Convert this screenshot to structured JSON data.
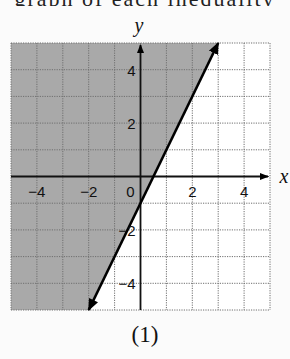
{
  "header_fragment": "graph of each inequality",
  "caption": "(1)",
  "colors": {
    "shade": "#a9a9a9",
    "grid": "#6f6f6f",
    "axis": "#111111",
    "line": "#000000",
    "background": "#fbfbfb"
  },
  "chart_data": {
    "type": "line",
    "title": "",
    "caption": "(1)",
    "xlabel": "x",
    "ylabel": "y",
    "xlim": [
      -5,
      5
    ],
    "ylim": [
      -5,
      5
    ],
    "grid": true,
    "grid_step": 1,
    "x_tick_labels": [
      "-4",
      "-2",
      "0",
      "2",
      "4"
    ],
    "y_tick_labels": [
      "4",
      "2",
      "-2",
      "-4"
    ],
    "series": [
      {
        "name": "boundary line y = 2x - 1",
        "style": "solid",
        "arrows": "both ends",
        "x": [
          -2,
          3
        ],
        "y": [
          -5,
          5
        ]
      }
    ],
    "shaded_region": {
      "description": "region to the left of / above the line",
      "inequality": "y > 2x - 1",
      "polygon": [
        [
          -5,
          5
        ],
        [
          3,
          5
        ],
        [
          -2,
          -5
        ],
        [
          -5,
          -5
        ]
      ]
    }
  }
}
